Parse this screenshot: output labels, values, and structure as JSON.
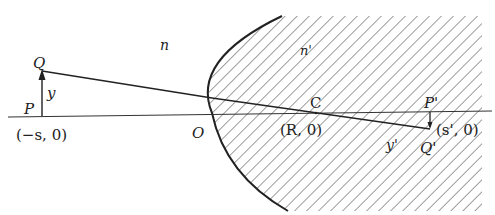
{
  "figure": {
    "colors": {
      "ink": "#222222",
      "hatch": "#3a3a3a",
      "background": "#ffffff"
    },
    "labels": {
      "medium_left": "n",
      "medium_right": "n'",
      "object_top": "Q",
      "object_base": "P",
      "object_height": "y",
      "object_coord": "(−s, 0)",
      "vertex": "O",
      "center": "C",
      "center_coord": "(R, 0)",
      "image_base": "P'",
      "image_top": "Q'",
      "image_height": "y'",
      "image_coord": "(s', 0)"
    }
  }
}
